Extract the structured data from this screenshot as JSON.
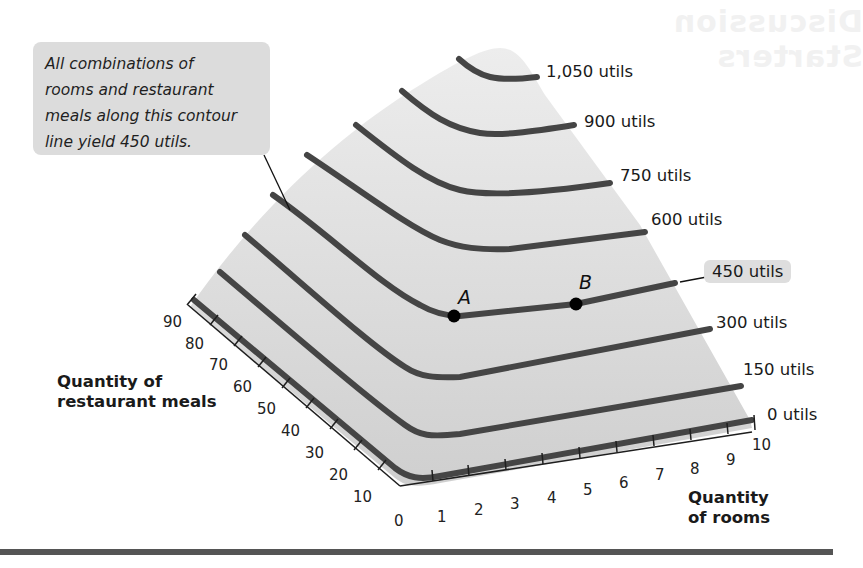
{
  "figure": {
    "callout": {
      "lines": [
        "All combinations of",
        "rooms and restaurant",
        "meals along this contour",
        "line yield 450 utils."
      ]
    },
    "contour_labels": [
      {
        "value": 1050,
        "text": "1,050 utils"
      },
      {
        "value": 900,
        "text": "900 utils"
      },
      {
        "value": 750,
        "text": "750 utils"
      },
      {
        "value": 600,
        "text": "600 utils"
      },
      {
        "value": 450,
        "text": "450 utils",
        "highlighted": true
      },
      {
        "value": 300,
        "text": "300 utils"
      },
      {
        "value": 150,
        "text": "150 utils"
      },
      {
        "value": 0,
        "text": "0 utils"
      }
    ],
    "points": [
      {
        "label": "A",
        "on_contour": 450
      },
      {
        "label": "B",
        "on_contour": 450
      }
    ],
    "axes": {
      "rooms": {
        "title_line1": "Quantity",
        "title_line2": "of rooms",
        "ticks": [
          "1",
          "2",
          "3",
          "4",
          "5",
          "6",
          "7",
          "8",
          "9",
          "10"
        ]
      },
      "meals": {
        "title_line1": "Quantity of",
        "title_line2": "restaurant meals",
        "ticks": [
          "10",
          "20",
          "30",
          "40",
          "50",
          "60",
          "70",
          "80",
          "90"
        ]
      },
      "origin": "0"
    },
    "colors": {
      "surface_top": "#ececec",
      "surface_bottom": "#cfcfcf",
      "contour": "#454545",
      "point": "#000000",
      "callout_bg": "#dcdcdc"
    }
  }
}
